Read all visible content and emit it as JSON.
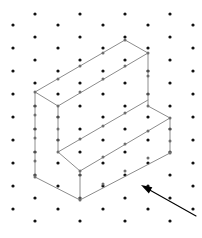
{
  "figure": {
    "background_color": "#ffffff",
    "width": 202,
    "height": 238
  },
  "dot_grid": {
    "name": "isometric-dot-lattice",
    "dot_color": "#111111",
    "dot_radius": 1.6,
    "column_spacing_px": 22.5,
    "row_spacing_px": 23,
    "row_offset_px": 11.5,
    "origin_x": 13,
    "origin_y": 14,
    "columns": 9,
    "rows": 10,
    "points": [
      [
        35,
        14
      ],
      [
        80,
        14
      ],
      [
        125,
        14
      ],
      [
        170,
        14
      ],
      [
        13,
        25
      ],
      [
        58,
        25
      ],
      [
        103,
        25
      ],
      [
        148,
        25
      ],
      [
        193,
        25
      ],
      [
        35,
        37
      ],
      [
        80,
        37
      ],
      [
        125,
        37
      ],
      [
        170,
        37
      ],
      [
        13,
        48
      ],
      [
        58,
        48
      ],
      [
        103,
        48
      ],
      [
        148,
        48
      ],
      [
        193,
        48
      ],
      [
        35,
        60
      ],
      [
        80,
        60
      ],
      [
        125,
        60
      ],
      [
        170,
        60
      ],
      [
        13,
        71
      ],
      [
        58,
        71
      ],
      [
        103,
        71
      ],
      [
        148,
        71
      ],
      [
        193,
        71
      ],
      [
        35,
        83
      ],
      [
        80,
        83
      ],
      [
        125,
        83
      ],
      [
        170,
        83
      ],
      [
        13,
        94
      ],
      [
        58,
        94
      ],
      [
        103,
        94
      ],
      [
        148,
        94
      ],
      [
        193,
        94
      ],
      [
        35,
        106
      ],
      [
        80,
        106
      ],
      [
        125,
        106
      ],
      [
        170,
        106
      ],
      [
        13,
        117
      ],
      [
        58,
        117
      ],
      [
        103,
        117
      ],
      [
        148,
        117
      ],
      [
        193,
        117
      ],
      [
        35,
        129
      ],
      [
        80,
        129
      ],
      [
        125,
        129
      ],
      [
        170,
        129
      ],
      [
        13,
        140
      ],
      [
        58,
        140
      ],
      [
        103,
        140
      ],
      [
        148,
        140
      ],
      [
        193,
        140
      ],
      [
        35,
        152
      ],
      [
        80,
        152
      ],
      [
        125,
        152
      ],
      [
        170,
        152
      ],
      [
        13,
        163
      ],
      [
        58,
        163
      ],
      [
        103,
        163
      ],
      [
        148,
        163
      ],
      [
        193,
        163
      ],
      [
        35,
        175
      ],
      [
        80,
        175
      ],
      [
        125,
        175
      ],
      [
        170,
        175
      ],
      [
        13,
        186
      ],
      [
        58,
        186
      ],
      [
        103,
        186
      ],
      [
        148,
        186
      ],
      [
        193,
        186
      ],
      [
        35,
        198
      ],
      [
        80,
        198
      ],
      [
        125,
        198
      ],
      [
        170,
        198
      ],
      [
        13,
        209
      ],
      [
        58,
        209
      ],
      [
        103,
        209
      ],
      [
        148,
        209
      ],
      [
        193,
        209
      ],
      [
        35,
        221
      ],
      [
        80,
        221
      ],
      [
        125,
        221
      ],
      [
        170,
        221
      ]
    ]
  },
  "solid": {
    "name": "l-shaped-step-block",
    "edge_color": "#8c8c8c",
    "face_color": "#ffffff",
    "vertex_marker_color": "#6e6e6e",
    "description": "Isometric L-shaped (single step) rectangular solid",
    "faces": {
      "tall_top": [
        [
          35,
          92
        ],
        [
          125,
          40
        ],
        [
          148,
          53
        ],
        [
          58,
          106
        ]
      ],
      "step_top": [
        [
          58,
          106
        ],
        [
          148,
          53
        ],
        [
          148,
          106
        ],
        [
          170,
          118
        ],
        [
          80,
          171
        ],
        [
          58,
          152
        ]
      ],
      "left_side": [
        [
          35,
          92
        ],
        [
          58,
          106
        ],
        [
          58,
          152
        ],
        [
          80,
          166
        ],
        [
          80,
          200
        ],
        [
          35,
          177
        ]
      ],
      "front_lower": [
        [
          80,
          171
        ],
        [
          170,
          118
        ],
        [
          170,
          153
        ],
        [
          80,
          200
        ]
      ],
      "front_upper": [
        [
          58,
          106
        ],
        [
          148,
          53
        ],
        [
          148,
          106
        ],
        [
          58,
          152
        ]
      ],
      "right_side": [
        [
          148,
          53
        ],
        [
          148,
          106
        ],
        [
          170,
          118
        ],
        [
          170,
          64
        ]
      ]
    },
    "edges": [
      [
        [
          35,
          92
        ],
        [
          125,
          40
        ]
      ],
      [
        [
          125,
          40
        ],
        [
          148,
          53
        ]
      ],
      [
        [
          148,
          53
        ],
        [
          58,
          106
        ]
      ],
      [
        [
          58,
          106
        ],
        [
          35,
          92
        ]
      ],
      [
        [
          35,
          92
        ],
        [
          35,
          177
        ]
      ],
      [
        [
          58,
          106
        ],
        [
          58,
          152
        ]
      ],
      [
        [
          148,
          53
        ],
        [
          148,
          106
        ]
      ],
      [
        [
          58,
          152
        ],
        [
          148,
          100
        ]
      ],
      [
        [
          148,
          106
        ],
        [
          170,
          118
        ]
      ],
      [
        [
          170,
          118
        ],
        [
          80,
          171
        ]
      ],
      [
        [
          80,
          171
        ],
        [
          58,
          152
        ]
      ],
      [
        [
          80,
          171
        ],
        [
          80,
          200
        ]
      ],
      [
        [
          170,
          118
        ],
        [
          170,
          153
        ]
      ],
      [
        [
          170,
          153
        ],
        [
          80,
          200
        ]
      ],
      [
        [
          80,
          200
        ],
        [
          35,
          177
        ]
      ]
    ],
    "lattice_nodes": [
      [
        35,
        92
      ],
      [
        58,
        79
      ],
      [
        80,
        66
      ],
      [
        103,
        53
      ],
      [
        125,
        40
      ],
      [
        148,
        53
      ],
      [
        125,
        66
      ],
      [
        103,
        79
      ],
      [
        80,
        92
      ],
      [
        58,
        106
      ],
      [
        35,
        115
      ],
      [
        35,
        138
      ],
      [
        35,
        161
      ],
      [
        35,
        177
      ],
      [
        58,
        129
      ],
      [
        58,
        152
      ],
      [
        148,
        76
      ],
      [
        148,
        106
      ],
      [
        80,
        139
      ],
      [
        103,
        126
      ],
      [
        125,
        113
      ],
      [
        170,
        118
      ],
      [
        148,
        131
      ],
      [
        125,
        144
      ],
      [
        103,
        157
      ],
      [
        80,
        171
      ],
      [
        170,
        141
      ],
      [
        80,
        200
      ],
      [
        103,
        184
      ],
      [
        125,
        171
      ],
      [
        148,
        158
      ],
      [
        170,
        153
      ]
    ]
  },
  "arrow": {
    "name": "pointer-arrow",
    "color": "#000000",
    "tail": [
      196,
      216
    ],
    "tip": [
      141,
      185
    ],
    "head_length": 11,
    "head_width": 7
  }
}
